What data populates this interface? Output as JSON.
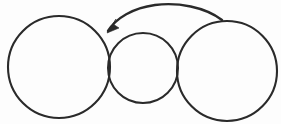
{
  "figure": {
    "title": "Three overlapping circles with a curved arrow",
    "background_color": "#fdfdfd",
    "stroke_color": "#2a2a2a",
    "width": 281,
    "height": 124
  },
  "shapes": {
    "left_circle": {
      "name": "large left circle",
      "cx": 59,
      "cy": 67,
      "r": 51,
      "stroke_width": 2.1
    },
    "middle_circle": {
      "name": "small middle circle",
      "cx": 143,
      "cy": 68,
      "r": 35,
      "stroke_width": 2.0
    },
    "right_circle": {
      "name": "large right circle",
      "cx": 227,
      "cy": 71,
      "r": 50,
      "stroke_width": 2.1
    }
  },
  "arrow": {
    "name": "curved arrow pointing left",
    "direction": "right-to-left",
    "stroke_width": 2.4,
    "path": "M 222 20 C 205 7, 178 2, 155 5 C 133 8, 116 18, 108 31",
    "head_points": "107,33 119,28 113,24 116,19",
    "tail_point": {
      "x": 222,
      "y": 20
    },
    "tip_point": {
      "x": 107,
      "y": 33
    },
    "apex_point": {
      "x": 168,
      "y": 4
    }
  }
}
